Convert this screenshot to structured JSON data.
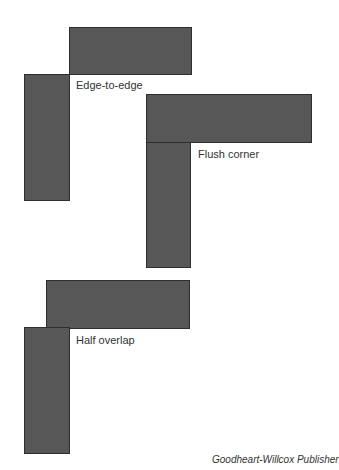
{
  "diagram": {
    "board_fill_color": "#575757",
    "board_edge_color": "#2e2e2e",
    "joints": [
      {
        "name": "edge-to-edge",
        "label": "Edge-to-edge",
        "horizontal_board": {
          "x": 69,
          "y": 27,
          "w": 123,
          "h": 47
        },
        "vertical_board": {
          "x": 24,
          "y": 74,
          "w": 46,
          "h": 126
        }
      },
      {
        "name": "flush-corner",
        "label": "Flush corner",
        "horizontal_board": {
          "x": 146,
          "y": 94,
          "w": 166,
          "h": 49
        },
        "vertical_board": {
          "x": 146,
          "y": 142,
          "w": 45,
          "h": 125
        }
      },
      {
        "name": "half-overlap",
        "label": "Half overlap",
        "horizontal_board": {
          "x": 46,
          "y": 280,
          "w": 144,
          "h": 48
        },
        "vertical_board": {
          "x": 24,
          "y": 327,
          "w": 46,
          "h": 126
        }
      }
    ],
    "credit": "Goodheart-Willcox Publisher"
  }
}
